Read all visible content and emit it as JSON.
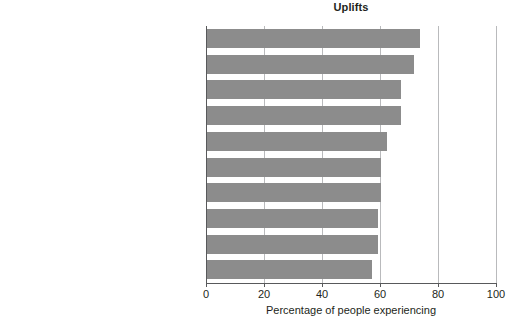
{
  "chart_data": {
    "type": "bar",
    "orientation": "horizontal",
    "title": "Uplifts",
    "xlabel": "Percentage of people experiencing",
    "ylabel": "",
    "xlim": [
      0,
      100
    ],
    "xticks": [
      0,
      20,
      40,
      60,
      80,
      100
    ],
    "xtick_labels": [
      "0",
      "20",
      "40",
      "60",
      "80",
      "100"
    ],
    "grid": true,
    "grid_axis": "x",
    "legend": false,
    "bar_color": "#8c8c8c",
    "axis_color": "#58595b",
    "grid_color": "#b9babc",
    "categories": [
      "Relating well with spouse or lover",
      "Relating well with friends",
      "Completing a task",
      "Feeling healthy",
      "Getting enough sleep",
      "Eating out",
      "Meeting responsibilities",
      "Visiting, phoning, or writing someone",
      "Spending time with family",
      "Home (inside) pleasing to you"
    ],
    "values": [
      73.5,
      71.5,
      67,
      67,
      62,
      60,
      60,
      59,
      59,
      57
    ]
  }
}
